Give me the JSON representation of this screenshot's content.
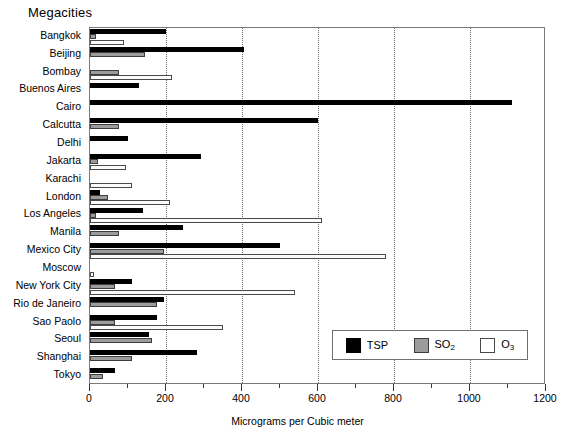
{
  "chart_data": {
    "type": "bar",
    "orientation": "horizontal",
    "title": "Megacities",
    "xlabel": "Micrograms per Cubic meter",
    "ylabel": "",
    "xlim": [
      0,
      1200
    ],
    "xticks": [
      0,
      200,
      400,
      600,
      800,
      1000,
      1200
    ],
    "xtick_labels": [
      "0",
      "200",
      "400",
      "600",
      "800",
      "1000",
      "1200"
    ],
    "minor_tick_step": 100,
    "grid": "vertical-dotted",
    "legend_position": "lower-right",
    "categories": [
      "Bangkok",
      "Beijing",
      "Bombay",
      "Buenos Aires",
      "Cairo",
      "Calcutta",
      "Delhi",
      "Jakarta",
      "Karachi",
      "London",
      "Los Angeles",
      "Manila",
      "Mexico City",
      "Moscow",
      "New York City",
      "Rio de Janeiro",
      "Sao Paolo",
      "Seoul",
      "Shanghai",
      "Tokyo"
    ],
    "series": [
      {
        "name": "TSP",
        "color": "#000000",
        "values": [
          200,
          405,
          0,
          130,
          1110,
          600,
          100,
          292,
          0,
          25,
          140,
          245,
          500,
          0,
          110,
          195,
          175,
          155,
          282,
          65
        ]
      },
      {
        "name": "SO2",
        "color": "#9b9b9b",
        "values": [
          15,
          145,
          77,
          0,
          0,
          75,
          0,
          20,
          0,
          47,
          17,
          75,
          195,
          0,
          65,
          175,
          65,
          163,
          110,
          35
        ]
      },
      {
        "name": "O3",
        "color": "#ffffff",
        "values": [
          90,
          0,
          215,
          0,
          0,
          0,
          0,
          95,
          110,
          210,
          610,
          0,
          780,
          10,
          540,
          0,
          350,
          0,
          0,
          0
        ]
      }
    ]
  },
  "legend": {
    "items": [
      {
        "label": "TSP",
        "sub": "",
        "swatch": "tsp"
      },
      {
        "label": "SO",
        "sub": "2",
        "swatch": "so2"
      },
      {
        "label": "O",
        "sub": "3",
        "swatch": "o3"
      }
    ]
  }
}
